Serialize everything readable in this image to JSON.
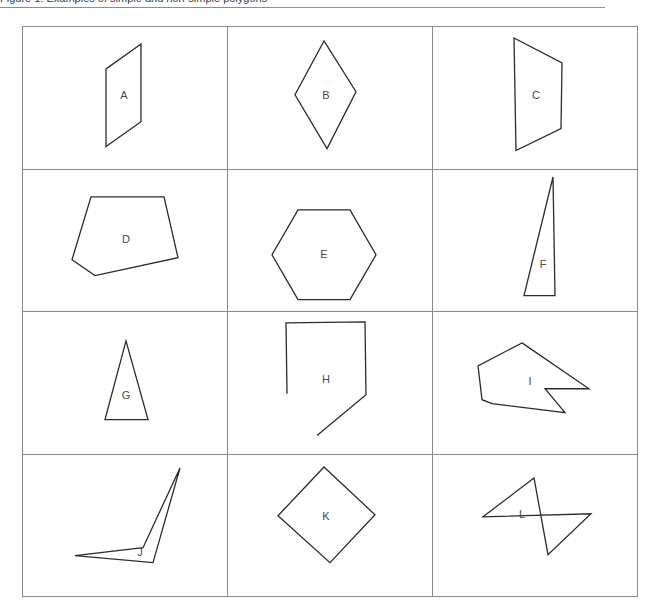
{
  "page": {
    "caption": "Figure 1: Examples of simple and non-simple polygons",
    "background_color": "#ffffff",
    "rule_color": "#8d8d8d"
  },
  "table": {
    "columns": 3,
    "rows": 4,
    "border_color": "#8a8a8a",
    "stroke_color": "#2b2b2b",
    "label_color": "#4a4a4a",
    "cells": [
      {
        "label": "A",
        "shape_name": "parallelogram",
        "closed": true,
        "points": "118,17 83,42 83,120 118,95",
        "label_x": 101,
        "label_y": 69
      },
      {
        "label": "B",
        "shape_name": "rhombus",
        "closed": true,
        "points": "96,14 128,65 99,122 67,68",
        "label_x": 98,
        "label_y": 69
      },
      {
        "label": "C",
        "shape_name": "trapezoid",
        "closed": true,
        "points": "81,11 129,36 128,102 83,124",
        "label_x": 103,
        "label_y": 69
      },
      {
        "label": "D",
        "shape_name": "pentagon",
        "closed": true,
        "points": "68,27 141,27 155,88 72,106 49,90",
        "label_x": 103,
        "label_y": 70
      },
      {
        "label": "E",
        "shape_name": "hexagon",
        "closed": true,
        "points": "70,40 122,40 148,85 122,130 70,130 44,85",
        "label_x": 96,
        "label_y": 85
      },
      {
        "label": "F",
        "shape_name": "right-triangle",
        "closed": true,
        "points": "120,7 122,126 91,126",
        "label_x": 110,
        "label_y": 95
      },
      {
        "label": "G",
        "shape_name": "isosceles-triangle",
        "closed": true,
        "points": "103,29 125,108 82,108",
        "label_x": 103,
        "label_y": 84
      },
      {
        "label": "H",
        "shape_name": "open-polyline",
        "closed": false,
        "points": "59,82 58,11 137,10 138,83 89,124",
        "label_x": 98,
        "label_y": 68
      },
      {
        "label": "I",
        "shape_name": "concave-arrow-polygon",
        "closed": true,
        "points": "89,31 156,77 112,77 132,101 59,92 49,88 45,54",
        "label_x": 97,
        "label_y": 70
      },
      {
        "label": "J",
        "shape_name": "thin-v-polygon",
        "closed": true,
        "points": "157,13 130,108 52,101 120,93",
        "label_x": 117,
        "label_y": 98
      },
      {
        "label": "K",
        "shape_name": "rotated-square",
        "closed": true,
        "points": "96,12 147,60 102,108 50,61",
        "label_x": 98,
        "label_y": 62
      },
      {
        "label": "L",
        "shape_name": "self-intersecting-quadrilateral",
        "closed": true,
        "points": "101,23 50,62 158,59 115,100",
        "label_x": 89,
        "label_y": 60
      }
    ]
  }
}
